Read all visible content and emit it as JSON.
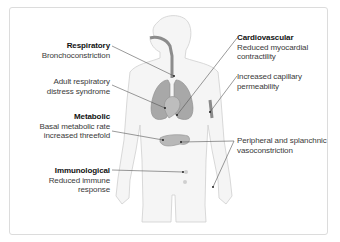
{
  "diagram": {
    "callouts": [
      {
        "id": "respiratory",
        "heading": "Respiratory",
        "lines": [
          "Bronchoconstriction"
        ]
      },
      {
        "id": "ards",
        "heading": "",
        "lines": [
          "Adult respiratory",
          "distress syndrome"
        ]
      },
      {
        "id": "metabolic",
        "heading": "Metabolic",
        "lines": [
          "Basal metabolic rate",
          "increased threefold"
        ]
      },
      {
        "id": "immunological",
        "heading": "Immunological",
        "lines": [
          "Reduced immune",
          "response"
        ]
      },
      {
        "id": "cardiovascular",
        "heading": "Cardiovascular",
        "lines": [
          "Reduced myocardial",
          "contractility"
        ]
      },
      {
        "id": "capillary",
        "heading": "",
        "lines": [
          "Increased capillary",
          "permeability"
        ]
      },
      {
        "id": "peripheral",
        "heading": "",
        "lines": [
          "Peripheral and splanchnic",
          "vasoconstriction"
        ]
      }
    ],
    "colors": {
      "body_outline": "#c8c8c8",
      "body_fill": "#f4f4f4",
      "organ_fill": "#9a9a9a",
      "leader_line": "#555555",
      "heading": "#111111",
      "text": "#3a3a3a"
    }
  }
}
